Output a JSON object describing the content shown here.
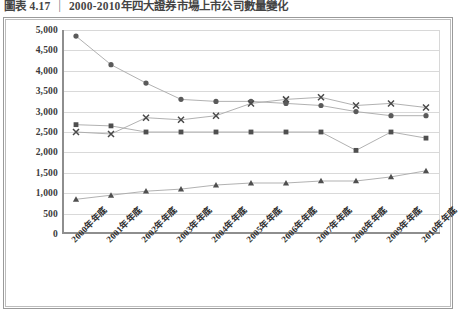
{
  "caption": {
    "figure_number": "圖表 4.17",
    "separator": "|",
    "title": "2000-2010年四大證券市場上市公司數量變化"
  },
  "chart_data": {
    "type": "line",
    "title": "2000-2010年四大證券市場上市公司數量變化",
    "xlabel": "",
    "ylabel": "",
    "ylim": [
      0,
      5000
    ],
    "ytick_step": 500,
    "grid": true,
    "legend": "none",
    "categories": [
      "2000年年底",
      "2001年年底",
      "2002年年底",
      "2003年年底",
      "2004年年底",
      "2005年年底",
      "2006年年底",
      "2007年年底",
      "2008年年底",
      "2009年年底",
      "2010年年底"
    ],
    "ytick_labels": [
      "5,000",
      "4,500",
      "4,000",
      "3,500",
      "3,000",
      "2,500",
      "2,000",
      "1,500",
      "1,000",
      "500",
      "0"
    ],
    "ytick_values": [
      5000,
      4500,
      4000,
      3500,
      3000,
      2500,
      2000,
      1500,
      1000,
      500,
      0
    ],
    "series": [
      {
        "name": "series-circle",
        "marker": "circle",
        "color": "#5a5a5a",
        "values": [
          4850,
          4150,
          3700,
          3300,
          3250,
          3250,
          3200,
          3150,
          3000,
          2900,
          2900
        ]
      },
      {
        "name": "series-cross",
        "marker": "x",
        "color": "#4a4a4a",
        "values": [
          2500,
          2450,
          2850,
          2800,
          2900,
          3200,
          3300,
          3350,
          3150,
          3200,
          3100
        ]
      },
      {
        "name": "series-square",
        "marker": "square",
        "color": "#4f4f4f",
        "values": [
          2680,
          2650,
          2500,
          2500,
          2500,
          2500,
          2500,
          2500,
          2050,
          2500,
          2350
        ]
      },
      {
        "name": "series-triangle",
        "marker": "triangle",
        "color": "#4f4f4f",
        "values": [
          850,
          950,
          1050,
          1100,
          1200,
          1250,
          1250,
          1300,
          1300,
          1400,
          1550
        ]
      }
    ]
  }
}
